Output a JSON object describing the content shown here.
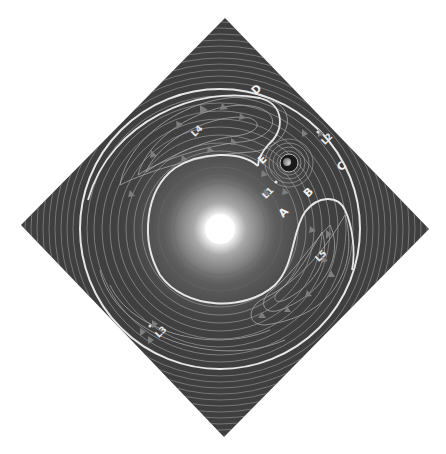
{
  "diagram": {
    "background_color": "#ffffff",
    "panel_color": "#3f3f3f",
    "contour_color": "#9a9a9a",
    "separatrix_color": "#e6e6e6",
    "arrow_color": "#7a7a7a",
    "star": {
      "name": "Sun",
      "cx": 220,
      "cy": 229,
      "core_radius": 15,
      "color": "#ffffff"
    },
    "planet": {
      "name": "Planet",
      "cx": 289,
      "cy": 163,
      "radius": 8
    },
    "labels": [
      {
        "id": "D",
        "text": "D",
        "x": 259,
        "y": 92,
        "rot": -45
      },
      {
        "id": "L4",
        "text": "L4",
        "x": 199,
        "y": 133,
        "rot": -45
      },
      {
        "id": "L2",
        "text": "L2",
        "x": 329,
        "y": 141,
        "rot": -45
      },
      {
        "id": "E",
        "text": "E",
        "x": 265,
        "y": 162,
        "rot": -45
      },
      {
        "id": "C",
        "text": "C",
        "x": 344,
        "y": 169,
        "rot": -45
      },
      {
        "id": "L1",
        "text": "L1",
        "x": 270,
        "y": 195,
        "rot": -45
      },
      {
        "id": "B",
        "text": "B",
        "x": 311,
        "y": 195,
        "rot": -45
      },
      {
        "id": "A",
        "text": "A",
        "x": 286,
        "y": 215,
        "rot": -45
      },
      {
        "id": "L5",
        "text": "L5",
        "x": 323,
        "y": 258,
        "rot": -45
      },
      {
        "id": "L3",
        "text": "L3",
        "x": 163,
        "y": 334,
        "rot": -45
      }
    ],
    "lagrange_points": [
      {
        "name": "L1",
        "x": 276,
        "y": 182
      },
      {
        "name": "L2",
        "x": 318,
        "y": 132
      },
      {
        "name": "L3",
        "x": 150,
        "y": 326
      },
      {
        "name": "L4",
        "x": 193,
        "y": 124
      },
      {
        "name": "L5",
        "x": 318,
        "y": 268
      }
    ]
  }
}
